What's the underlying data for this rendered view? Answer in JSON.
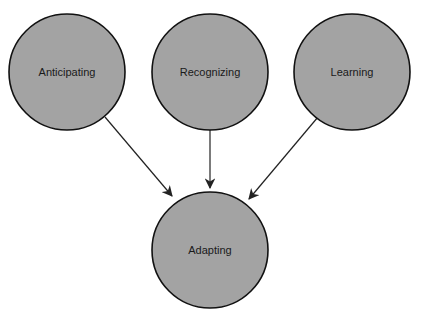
{
  "diagram": {
    "colors": {
      "node_fill": "#a3a3a3",
      "node_stroke": "#111111",
      "edge": "#222222",
      "background": "#ffffff"
    },
    "nodes": [
      {
        "id": "anticipating",
        "label": "Anticipating",
        "cx": 67,
        "cy": 72,
        "r": 58
      },
      {
        "id": "recognizing",
        "label": "Recognizing",
        "cx": 210,
        "cy": 72,
        "r": 58
      },
      {
        "id": "learning",
        "label": "Learning",
        "cx": 352,
        "cy": 72,
        "r": 58
      },
      {
        "id": "adapting",
        "label": "Adapting",
        "cx": 210,
        "cy": 250,
        "r": 58
      }
    ],
    "edges": [
      {
        "from": "anticipating",
        "to": "adapting",
        "x1": 105,
        "y1": 117,
        "x2": 172,
        "y2": 196
      },
      {
        "from": "recognizing",
        "to": "adapting",
        "x1": 210,
        "y1": 130,
        "x2": 210,
        "y2": 188
      },
      {
        "from": "learning",
        "to": "adapting",
        "x1": 318,
        "y1": 117,
        "x2": 249,
        "y2": 199
      }
    ]
  }
}
